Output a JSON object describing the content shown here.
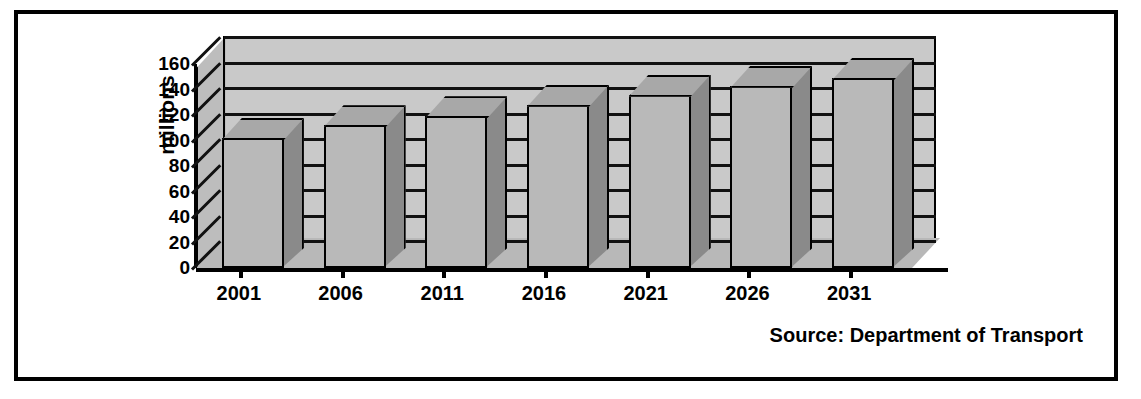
{
  "figure": {
    "frame_border_color": "#000000",
    "background_color": "#ffffff",
    "source_note": "Source: Department of Transport"
  },
  "axis": {
    "y_title": "millions",
    "y_ticks": [
      "160",
      "140",
      "120",
      "100",
      "80",
      "60",
      "40",
      "20",
      "0"
    ],
    "x_ticks": [
      "2001",
      "2006",
      "2011",
      "2016",
      "2021",
      "2026",
      "2031"
    ]
  },
  "colors": {
    "bar_front": "#b9b9b9",
    "bar_side": "#8a8a8a",
    "bar_top": "#a8a8a8",
    "wall": "#c9c9c9",
    "floor": "#b8b8b8",
    "outline": "#000000"
  },
  "chart_data": {
    "type": "bar",
    "title": "",
    "subtitle": "",
    "xlabel": "",
    "ylabel": "millions",
    "categories": [
      "2001",
      "2006",
      "2011",
      "2016",
      "2021",
      "2026",
      "2031"
    ],
    "values": [
      102,
      112,
      119,
      128,
      136,
      143,
      149
    ],
    "ylim": [
      0,
      160
    ],
    "ytick_interval": 20,
    "yticks": [
      0,
      20,
      40,
      60,
      80,
      100,
      120,
      140,
      160
    ],
    "grid": true,
    "legend": false,
    "three_d": true,
    "annotations": [
      "Source: Department of Transport"
    ]
  }
}
